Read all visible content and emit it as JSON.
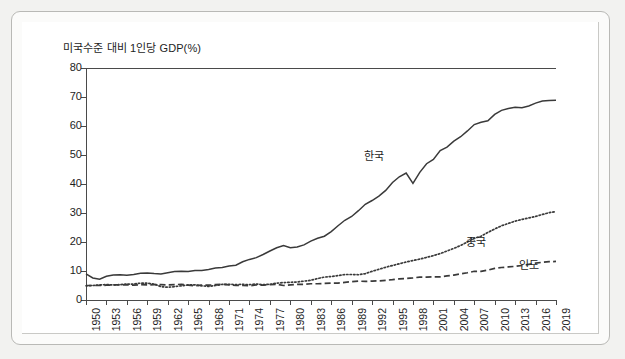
{
  "chart_data": {
    "type": "line",
    "title": "미국수준 대비 1인당 GDP(%)",
    "xlabel": "",
    "ylabel": "",
    "ylim": [
      0,
      80
    ],
    "yticks": [
      0,
      10,
      20,
      30,
      40,
      50,
      60,
      70,
      80
    ],
    "xlim": [
      1950,
      2019
    ],
    "xticks": [
      1950,
      1953,
      1956,
      1959,
      1962,
      1965,
      1968,
      1971,
      1974,
      1977,
      1980,
      1983,
      1986,
      1989,
      1992,
      1995,
      1998,
      2001,
      2004,
      2007,
      2010,
      2013,
      2016,
      2019
    ],
    "grid": false,
    "legend_position": "inline-annotations",
    "x": [
      1950,
      1951,
      1952,
      1953,
      1954,
      1955,
      1956,
      1957,
      1958,
      1959,
      1960,
      1961,
      1962,
      1963,
      1964,
      1965,
      1966,
      1967,
      1968,
      1969,
      1970,
      1971,
      1972,
      1973,
      1974,
      1975,
      1976,
      1977,
      1978,
      1979,
      1980,
      1981,
      1982,
      1983,
      1984,
      1985,
      1986,
      1987,
      1988,
      1989,
      1990,
      1991,
      1992,
      1993,
      1994,
      1995,
      1996,
      1997,
      1998,
      1999,
      2000,
      2001,
      2002,
      2003,
      2004,
      2005,
      2006,
      2007,
      2008,
      2009,
      2010,
      2011,
      2012,
      2013,
      2014,
      2015,
      2016,
      2017,
      2018,
      2019
    ],
    "series": [
      {
        "name": "한국",
        "style": "solid",
        "color": "#3a3a3a",
        "label_text": "한국",
        "values": [
          9.0,
          7.6,
          7.2,
          8.2,
          8.6,
          8.7,
          8.5,
          8.8,
          9.2,
          9.3,
          9.1,
          9.0,
          9.4,
          9.8,
          9.9,
          9.8,
          10.2,
          10.2,
          10.5,
          11.0,
          11.2,
          11.7,
          12.0,
          13.2,
          14.0,
          14.6,
          15.7,
          16.9,
          18.0,
          18.8,
          18.0,
          18.3,
          19.0,
          20.3,
          21.3,
          22.0,
          23.6,
          25.6,
          27.5,
          28.8,
          30.8,
          33.0,
          34.3,
          35.8,
          37.8,
          40.5,
          42.5,
          43.8,
          40.2,
          44.0,
          47.0,
          48.5,
          51.5,
          52.7,
          54.8,
          56.3,
          58.3,
          60.5,
          61.3,
          61.8,
          64.0,
          65.4,
          66.0,
          66.5,
          66.3,
          66.9,
          67.9,
          68.6,
          68.8,
          68.9
        ]
      },
      {
        "name": "중국",
        "style": "dotted",
        "color": "#3a3a3a",
        "label_text": "중국",
        "values": [
          4.9,
          5.0,
          5.2,
          5.3,
          5.2,
          5.3,
          5.5,
          5.5,
          5.8,
          5.8,
          5.5,
          4.6,
          4.4,
          4.6,
          4.9,
          5.2,
          5.2,
          4.9,
          4.7,
          5.0,
          5.4,
          5.4,
          5.3,
          5.4,
          5.3,
          5.5,
          5.3,
          5.4,
          5.8,
          6.0,
          6.1,
          6.2,
          6.5,
          6.8,
          7.4,
          7.9,
          8.1,
          8.4,
          8.8,
          8.8,
          8.7,
          9.1,
          9.9,
          10.6,
          11.3,
          11.9,
          12.5,
          13.1,
          13.6,
          14.1,
          14.7,
          15.3,
          16.0,
          16.9,
          17.8,
          18.8,
          20.0,
          21.3,
          22.0,
          23.3,
          24.5,
          25.6,
          26.4,
          27.2,
          27.8,
          28.3,
          28.8,
          29.5,
          30.1,
          30.5
        ]
      },
      {
        "name": "인도",
        "style": "dashed",
        "color": "#3a3a3a",
        "label_text": "인도",
        "values": [
          5.0,
          5.0,
          5.0,
          5.1,
          5.2,
          5.2,
          5.3,
          5.1,
          5.3,
          5.2,
          5.3,
          5.3,
          5.2,
          5.3,
          5.4,
          5.1,
          4.9,
          5.1,
          5.1,
          5.3,
          5.4,
          5.2,
          5.0,
          5.0,
          4.9,
          5.2,
          5.1,
          5.3,
          5.4,
          5.0,
          5.2,
          5.4,
          5.4,
          5.6,
          5.6,
          5.7,
          5.8,
          5.8,
          6.1,
          6.3,
          6.5,
          6.4,
          6.5,
          6.6,
          6.8,
          7.0,
          7.3,
          7.4,
          7.6,
          7.9,
          7.9,
          8.0,
          8.0,
          8.3,
          8.6,
          9.0,
          9.4,
          9.9,
          9.9,
          10.3,
          10.9,
          11.2,
          11.4,
          11.6,
          11.9,
          12.3,
          12.7,
          13.0,
          13.2,
          13.3
        ]
      }
    ]
  },
  "frame": {
    "page_background": "#f2f2f0",
    "panel_background": "#ffffff",
    "axis_color": "#4a4a4a"
  }
}
